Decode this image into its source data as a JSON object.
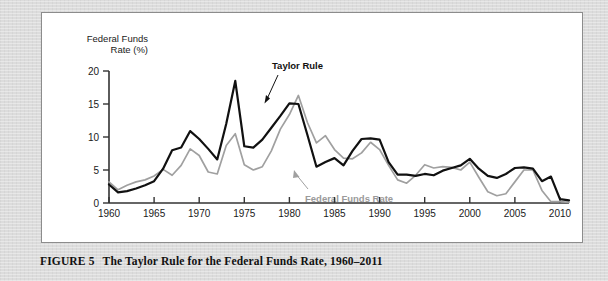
{
  "caption": {
    "figure_number": "FIGURE 5",
    "text": "The Taylor Rule for the Federal Funds Rate, 1960–2011"
  },
  "axis_title_line1": "Federal Funds",
  "axis_title_line2": "Rate (%)",
  "annotations": {
    "taylor_rule": "Taylor Rule",
    "federal_funds_rate": "Federal Funds Rate"
  },
  "colors": {
    "taylor_rule": "#111111",
    "federal_funds_rate": "#a0a0a0",
    "axis": "#333333",
    "panel_bg": "#ffffff",
    "page_bg": "#dcdcdc"
  },
  "chart_data": {
    "type": "line",
    "title": "The Taylor Rule for the Federal Funds Rate, 1960–2011",
    "xlabel": "",
    "ylabel": "Federal Funds Rate (%)",
    "xlim": [
      1960,
      2011
    ],
    "ylim": [
      0,
      20
    ],
    "yticks": [
      0,
      5,
      10,
      15,
      20
    ],
    "xticks": [
      1960,
      1965,
      1970,
      1975,
      1980,
      1985,
      1990,
      1995,
      2000,
      2005,
      2010
    ],
    "grid": false,
    "legend": "inline-annotations",
    "x": [
      1960,
      1961,
      1962,
      1963,
      1964,
      1965,
      1966,
      1967,
      1968,
      1969,
      1970,
      1971,
      1972,
      1973,
      1974,
      1975,
      1976,
      1977,
      1978,
      1979,
      1980,
      1981,
      1982,
      1983,
      1984,
      1985,
      1986,
      1987,
      1988,
      1989,
      1990,
      1991,
      1992,
      1993,
      1994,
      1995,
      1996,
      1997,
      1998,
      1999,
      2000,
      2001,
      2002,
      2003,
      2004,
      2005,
      2006,
      2007,
      2008,
      2009,
      2010,
      2011
    ],
    "series": [
      {
        "name": "Taylor Rule",
        "color": "#111111",
        "values": [
          2.8,
          1.6,
          1.8,
          2.2,
          2.7,
          3.3,
          5.2,
          8.0,
          8.4,
          10.9,
          9.7,
          8.2,
          6.6,
          12.0,
          18.5,
          8.6,
          8.4,
          9.6,
          11.4,
          13.2,
          15.1,
          15.0,
          10.3,
          5.5,
          6.2,
          6.8,
          5.7,
          7.9,
          9.7,
          9.8,
          9.6,
          6.2,
          4.3,
          4.3,
          4.1,
          4.4,
          4.2,
          4.9,
          5.3,
          5.7,
          6.7,
          5.2,
          4.1,
          3.8,
          4.4,
          5.3,
          5.4,
          5.2,
          3.3,
          4.0,
          0.6,
          0.4
        ]
      },
      {
        "name": "Federal Funds Rate",
        "color": "#a0a0a0",
        "values": [
          3.2,
          2.0,
          2.7,
          3.2,
          3.5,
          4.1,
          5.1,
          4.2,
          5.7,
          8.2,
          7.2,
          4.7,
          4.4,
          8.7,
          10.5,
          5.8,
          5.0,
          5.5,
          7.9,
          11.2,
          13.4,
          16.3,
          12.2,
          9.1,
          10.2,
          8.1,
          6.8,
          6.7,
          7.6,
          9.2,
          8.1,
          5.7,
          3.5,
          3.0,
          4.2,
          5.8,
          5.3,
          5.5,
          5.4,
          5.0,
          6.2,
          3.9,
          1.7,
          1.1,
          1.4,
          3.2,
          5.0,
          5.0,
          1.9,
          0.2,
          0.2,
          0.1
        ]
      }
    ]
  }
}
